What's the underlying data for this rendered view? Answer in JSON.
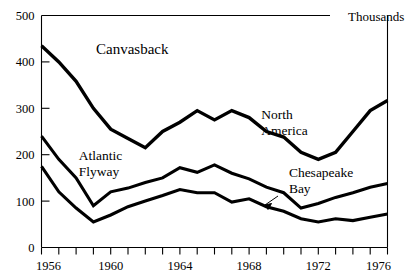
{
  "chart_data": {
    "type": "line",
    "title": "Canvasback",
    "units_label": "Thousands",
    "xlabel": "",
    "ylabel": "",
    "xlim": [
      1956,
      1976
    ],
    "ylim": [
      0,
      500
    ],
    "ytick_values": [
      0,
      100,
      200,
      300,
      400,
      500
    ],
    "ytick_labels": [
      "0",
      "100",
      "200",
      "300",
      "400",
      "500"
    ],
    "xtick_values": [
      1956,
      1957,
      1958,
      1959,
      1960,
      1961,
      1962,
      1963,
      1964,
      1965,
      1966,
      1967,
      1968,
      1969,
      1970,
      1971,
      1972,
      1973,
      1974,
      1975,
      1976
    ],
    "xtick_labels_shown": [
      "1956",
      "1960",
      "1964",
      "1968",
      "1972",
      "1976"
    ],
    "grid": false,
    "legend": "inline-annotations",
    "x": [
      1956,
      1957,
      1958,
      1959,
      1960,
      1961,
      1962,
      1963,
      1964,
      1965,
      1966,
      1967,
      1968,
      1969,
      1970,
      1971,
      1972,
      1973,
      1974,
      1975,
      1976
    ],
    "series": [
      {
        "name": "North America",
        "label": "North\nAmerica",
        "label_line1": "North",
        "label_line2": "America",
        "values": [
          435,
          400,
          358,
          300,
          255,
          235,
          215,
          250,
          270,
          295,
          275,
          295,
          280,
          250,
          238,
          205,
          190,
          205,
          250,
          295,
          317
        ]
      },
      {
        "name": "Atlantic Flyway",
        "label": "Atlantic\nFlyway",
        "label_line1": "Atlantic",
        "label_line2": "Flyway",
        "values": [
          240,
          190,
          150,
          90,
          120,
          128,
          140,
          150,
          172,
          162,
          178,
          160,
          148,
          130,
          118,
          85,
          95,
          108,
          118,
          130,
          138
        ]
      },
      {
        "name": "Chesapeake Bay",
        "label": "Chesapeake\nBay",
        "label_line1": "Chesapeake",
        "label_line2": "Bay",
        "values": [
          175,
          120,
          85,
          55,
          70,
          88,
          100,
          112,
          125,
          118,
          118,
          98,
          105,
          88,
          78,
          62,
          55,
          62,
          58,
          65,
          72
        ]
      }
    ],
    "annotations": [
      {
        "name": "chart-title-canvasback",
        "text": "Canvasback",
        "x": 1959.2,
        "y": 420
      },
      {
        "name": "series-label-north-america",
        "text": "North America",
        "x": 1968.8,
        "y": 275
      },
      {
        "name": "series-label-atlantic-flyway",
        "text": "Atlantic Flyway",
        "x": 1958.2,
        "y": 185
      },
      {
        "name": "series-label-chesapeake-bay",
        "text": "Chesapeake Bay",
        "x": 1970.4,
        "y": 150
      },
      {
        "name": "units-label",
        "text": "Thousands",
        "x": 1975.2,
        "y": 495
      }
    ],
    "colors": {
      "line": "#000000",
      "axis": "#000000",
      "background": "#ffffff"
    }
  }
}
